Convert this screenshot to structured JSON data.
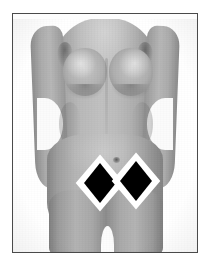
{
  "image": {
    "kind": "clinical-photograph",
    "subject": "female-torso-frontal",
    "color_mode": "grayscale",
    "caption": "",
    "frame": {
      "border_color": "#4a4a4a",
      "background_color": "#ffffff",
      "plate_background": "#fdfdfd"
    }
  },
  "tones": {
    "skin_light": "#c0c0c0",
    "skin_mid": "#aaaaaa",
    "skin_shadow": "#858585",
    "deep_shadow": "#5a5a5a",
    "page_background": "#ffffff"
  },
  "annotations": {
    "title": "",
    "markers": [
      {
        "id": "marker-left",
        "shape": "diamond",
        "fill_color": "#000000",
        "outline_color": "#ffffff",
        "label": "",
        "x": 87,
        "y": 169,
        "width": 21,
        "height": 29,
        "region": "left lower abdomen"
      },
      {
        "id": "marker-right",
        "shape": "diamond",
        "fill_color": "#000000",
        "outline_color": "#ffffff",
        "label": "",
        "x": 123,
        "y": 167,
        "width": 23,
        "height": 30,
        "region": "right lower abdomen"
      }
    ],
    "landmarks": [
      {
        "id": "navel",
        "label": "",
        "x": 104,
        "y": 146
      }
    ]
  }
}
